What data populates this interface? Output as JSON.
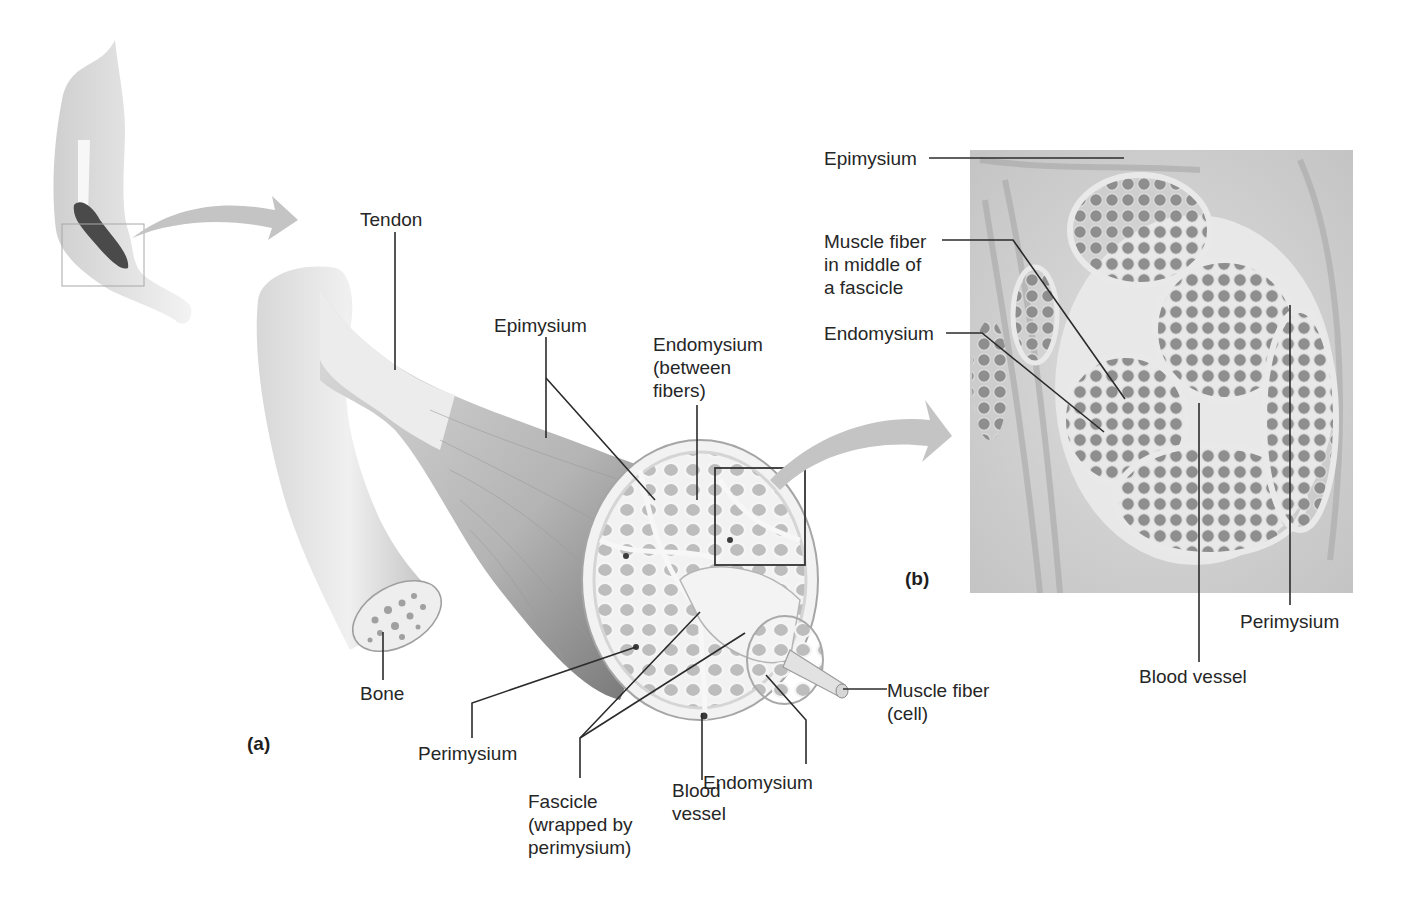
{
  "figure": {
    "panels": [
      {
        "id": "a",
        "label": "(a)",
        "x": 247,
        "y": 733
      },
      {
        "id": "b",
        "label": "(b)",
        "x": 905,
        "y": 568
      }
    ]
  },
  "icons": {
    "arm_thumbnail": "arm-icon",
    "arrow1": "curved-arrow-icon",
    "arrow2": "curved-arrow-icon",
    "zoom_box": "zoom-box-icon"
  },
  "labels_a": [
    {
      "key": "tendon",
      "text": "Tendon",
      "x": 360,
      "y": 208
    },
    {
      "key": "epimysium",
      "text": "Epimysium",
      "x": 494,
      "y": 314
    },
    {
      "key": "endomysium_between",
      "text": "Endomysium\n(between\nfibers)",
      "x": 653,
      "y": 333
    },
    {
      "key": "bone",
      "text": "Bone",
      "x": 360,
      "y": 682
    },
    {
      "key": "perimysium",
      "text": "Perimysium",
      "x": 418,
      "y": 742
    },
    {
      "key": "fascicle",
      "text": "Fascicle\n(wrapped by\nperimysium)",
      "x": 528,
      "y": 790
    },
    {
      "key": "blood_vessel",
      "text": "Blood\nvessel",
      "x": 672,
      "y": 779
    },
    {
      "key": "endomysium",
      "text": "Endomysium",
      "x": 703,
      "y": 771
    },
    {
      "key": "muscle_fiber_cell",
      "text": "Muscle fiber\n(cell)",
      "x": 887,
      "y": 679
    }
  ],
  "labels_b": [
    {
      "key": "epimysium_b",
      "text": "Epimysium",
      "x": 824,
      "y": 147
    },
    {
      "key": "muscle_fiber_middle",
      "text": "Muscle fiber\nin middle of\na fascicle",
      "x": 824,
      "y": 230
    },
    {
      "key": "endomysium_b",
      "text": "Endomysium",
      "x": 824,
      "y": 322
    },
    {
      "key": "blood_vessel_b",
      "text": "Blood vessel",
      "x": 1139,
      "y": 665
    },
    {
      "key": "perimysium_b",
      "text": "Perimysium",
      "x": 1240,
      "y": 610
    }
  ],
  "leader_lines": [
    {
      "points": "395,232 395,370"
    },
    {
      "points": "546,337 546,438"
    },
    {
      "points": "546,378 655,500"
    },
    {
      "points": "697,405 697,500"
    },
    {
      "points": "383,632 383,680"
    },
    {
      "points": "472,738 472,703 636,647"
    },
    {
      "points": "580,778 580,738 700,612"
    },
    {
      "points": "580,738 745,633"
    },
    {
      "points": "702,780 702,713"
    },
    {
      "points": "806,764 806,720 766,675"
    },
    {
      "points": "887,689 843,689"
    },
    {
      "points": "929,158 1124,158"
    },
    {
      "points": "942,240 1013,240 1125,399"
    },
    {
      "points": "946,333 982,333 1104,432"
    },
    {
      "points": "1199,662 1199,403"
    },
    {
      "points": "1290,605 1290,305"
    }
  ],
  "colors": {
    "background": "#ffffff",
    "text": "#262626",
    "line": "#2b2b2b",
    "arrow": "#c4c4c4",
    "tissue_light": "#e6e6e6",
    "tissue_mid": "#bcbcbc",
    "tissue_dark": "#6e6e6e",
    "micrograph_bg": "#d2d2d2",
    "fiber_gray": "#8f8f8f"
  }
}
